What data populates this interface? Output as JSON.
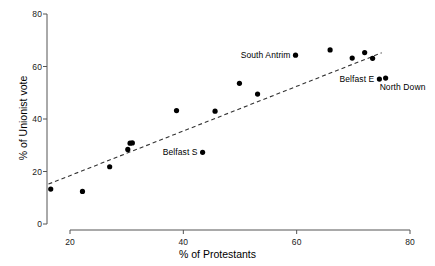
{
  "chart_data": {
    "type": "scatter",
    "title": "",
    "xlabel": "% of Protestants",
    "ylabel": "% of Unionist vote",
    "xlim": [
      15,
      80
    ],
    "ylim": [
      0,
      80
    ],
    "xticks": [
      20,
      40,
      60,
      80
    ],
    "xtick_labels": [
      "20",
      "40",
      "60",
      "80"
    ],
    "yticks": [
      0,
      20,
      40,
      60,
      80
    ],
    "ytick_labels": [
      "0",
      "20",
      "40",
      "60",
      "80"
    ],
    "grid": false,
    "legend": null,
    "marker": "filled-circle",
    "marker_color": "#000000",
    "points": [
      {
        "x": 16.6,
        "y": 13.3,
        "label": null
      },
      {
        "x": 22.2,
        "y": 12.4,
        "label": null
      },
      {
        "x": 27.0,
        "y": 21.8,
        "label": null
      },
      {
        "x": 30.2,
        "y": 28.4,
        "label": null
      },
      {
        "x": 30.6,
        "y": 30.8,
        "label": null
      },
      {
        "x": 31.0,
        "y": 30.9,
        "label": null
      },
      {
        "x": 38.8,
        "y": 43.2,
        "label": null
      },
      {
        "x": 43.4,
        "y": 27.3,
        "label": "Belfast S",
        "label_side": "left"
      },
      {
        "x": 45.6,
        "y": 43.0,
        "label": null
      },
      {
        "x": 49.9,
        "y": 53.6,
        "label": null
      },
      {
        "x": 53.1,
        "y": 49.5,
        "label": null
      },
      {
        "x": 59.8,
        "y": 64.3,
        "label": "South Antrim",
        "label_side": "left"
      },
      {
        "x": 65.9,
        "y": 66.3,
        "label": null
      },
      {
        "x": 69.8,
        "y": 63.2,
        "label": null
      },
      {
        "x": 72.0,
        "y": 65.3,
        "label": null
      },
      {
        "x": 73.4,
        "y": 63.1,
        "label": null
      },
      {
        "x": 74.6,
        "y": 55.2,
        "label": "Belfast E",
        "label_side": "left"
      },
      {
        "x": 75.7,
        "y": 55.6,
        "label": "North Down",
        "label_side": "right"
      }
    ],
    "trendline": {
      "style": "dashed",
      "color": "#333333",
      "x_start": 16.2,
      "y_start": 15.2,
      "x_end": 75.0,
      "y_end": 65.2
    },
    "colors": {
      "axis": "#555555",
      "marker": "#000000",
      "text": "#000000",
      "background": "#ffffff"
    }
  }
}
